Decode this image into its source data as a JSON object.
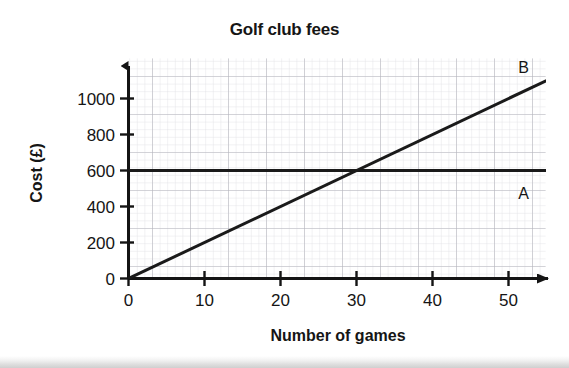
{
  "chart_data": {
    "type": "line",
    "title": "Golf club fees",
    "xlabel": "Number of games",
    "ylabel": "Cost (£)",
    "xlim": [
      0,
      55
    ],
    "ylim": [
      0,
      1160
    ],
    "x_ticks": [
      0,
      10,
      20,
      30,
      40,
      50
    ],
    "x_tick_labels": [
      "0",
      "10",
      "20",
      "30",
      "40",
      "50"
    ],
    "y_ticks": [
      0,
      200,
      400,
      600,
      800,
      1000
    ],
    "y_tick_labels": [
      "0",
      "200",
      "400",
      "600",
      "800",
      "1000"
    ],
    "grid": "minor and major squared grid",
    "grid_minor_step_x": 1,
    "grid_minor_step_y": 20,
    "grid_major_step_x": 5,
    "grid_major_step_y": 100,
    "legend_position": "inline labels at line ends",
    "series": [
      {
        "name": "A",
        "label": "A",
        "type": "horizontal-line",
        "color": "#1a1a1a",
        "intercept": 600,
        "slope": 0,
        "x": [
          0,
          55
        ],
        "values": [
          600,
          600
        ]
      },
      {
        "name": "B",
        "label": "B",
        "type": "line",
        "color": "#1a1a1a",
        "intercept": 0,
        "slope": 20,
        "x": [
          0,
          55
        ],
        "values": [
          0,
          1100
        ]
      }
    ],
    "annotations": [
      {
        "text": "B",
        "x": 52,
        "y": 1140
      },
      {
        "text": "A",
        "x": 52,
        "y": 440
      }
    ],
    "intersection": {
      "x": 30,
      "y": 600
    }
  },
  "axis_colors": {
    "axis": "#141414",
    "grid_minor": "#d9d9dd",
    "grid_major": "#b3b3bb",
    "series": "#1a1a1a"
  }
}
